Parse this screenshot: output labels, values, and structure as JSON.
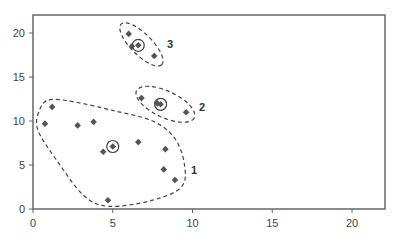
{
  "chart_data": {
    "type": "scatter",
    "title": "",
    "xlabel": "",
    "ylabel": "",
    "xlim": [
      0,
      22
    ],
    "ylim": [
      0,
      22
    ],
    "grid": false,
    "x_ticks": [
      0,
      5,
      10,
      15,
      20
    ],
    "y_ticks": [
      0,
      5,
      10,
      15,
      20
    ],
    "x_tick_labels": [
      "0",
      "5",
      "10",
      "15",
      "20"
    ],
    "y_tick_labels": [
      "0",
      "5",
      "10",
      "15",
      "20"
    ],
    "marker": "diamond",
    "colors": {
      "points": "#555555",
      "frame": "#666666",
      "outline": "#444444"
    },
    "clusters": [
      {
        "label": "1",
        "centroid": [
          5.0,
          7.1
        ],
        "points": [
          [
            1.2,
            11.6
          ],
          [
            0.75,
            9.7
          ],
          [
            2.8,
            9.5
          ],
          [
            3.8,
            9.9
          ],
          [
            4.4,
            6.5
          ],
          [
            5.0,
            7.1
          ],
          [
            6.6,
            7.6
          ],
          [
            8.3,
            6.8
          ],
          [
            8.2,
            4.5
          ],
          [
            8.9,
            3.3
          ],
          [
            4.7,
            1.0
          ]
        ],
        "label_pos": [
          9.9,
          4.4
        ],
        "outline": [
          [
            1.0,
            12.4
          ],
          [
            2.5,
            12.2
          ],
          [
            5.0,
            11.2
          ],
          [
            7.5,
            10.0
          ],
          [
            8.9,
            8.0
          ],
          [
            9.5,
            5.0
          ],
          [
            9.3,
            2.5
          ],
          [
            7.5,
            1.0
          ],
          [
            4.8,
            0.3
          ],
          [
            3.2,
            1.5
          ],
          [
            1.5,
            5.5
          ],
          [
            0.3,
            9.0
          ],
          [
            0.4,
            11.2
          ]
        ]
      },
      {
        "label": "2",
        "centroid": [
          8.0,
          11.9
        ],
        "points": [
          [
            6.8,
            12.6
          ],
          [
            7.8,
            12.0
          ],
          [
            8.0,
            11.9
          ],
          [
            9.6,
            11.0
          ]
        ],
        "label_pos": [
          10.4,
          11.6
        ],
        "outline_ellipse": {
          "cx": 8.3,
          "cy": 11.9,
          "rx": 2.0,
          "ry": 1.5,
          "rotation_deg": 25
        }
      },
      {
        "label": "3",
        "centroid": [
          6.6,
          18.6
        ],
        "points": [
          [
            6.0,
            19.9
          ],
          [
            6.2,
            18.5
          ],
          [
            6.6,
            18.6
          ],
          [
            7.6,
            17.4
          ]
        ],
        "label_pos": [
          8.4,
          18.8
        ],
        "outline_ellipse": {
          "cx": 6.8,
          "cy": 18.7,
          "rx": 1.8,
          "ry": 1.2,
          "rotation_deg": 45
        }
      }
    ]
  }
}
